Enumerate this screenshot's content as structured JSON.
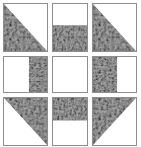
{
  "block": {
    "title": "Patchwork Quilt Block",
    "grid_label": "3x3 quilt block grid",
    "rows": 3,
    "columns": 3,
    "width_px": 141,
    "height_px": 147,
    "colors": {
      "background": "#ffffff",
      "plain_fabric": "#ffffff",
      "print_fabric_base": "#9e9e9e",
      "print_fabric_dark": "#1c1c1c",
      "print_fabric_light": "#c8c8c8",
      "seam_line": "#8d8d8d"
    },
    "fabrics": {
      "plain": "plain-white",
      "print": "mottled-camouflage-print"
    },
    "cells": [
      {
        "id": "cell-r1c1",
        "name": "top-left-corner",
        "patch_type": "half-square-triangle",
        "print_region": "lower-right-triangle",
        "print_polygon": "0,0 100,100 0,100",
        "plain_region": "upper-left-triangle"
      },
      {
        "id": "cell-r1c2",
        "name": "top-center-edge",
        "patch_type": "horizontal-split-rectangle",
        "print_region": "bottom-band",
        "print_polygon": "0,45 100,45 100,100 0,100",
        "plain_region": "top-band",
        "split_percent": 45
      },
      {
        "id": "cell-r1c3",
        "name": "top-right-corner",
        "patch_type": "half-square-triangle",
        "print_region": "lower-left-triangle",
        "print_polygon": "0,0 100,100 0,100",
        "plain_region": "upper-right-triangle"
      },
      {
        "id": "cell-r2c1",
        "name": "middle-left-edge",
        "patch_type": "vertical-split-rectangle",
        "print_region": "right-band",
        "print_polygon": "58,0 100,0 100,100 58,100",
        "plain_region": "left-band",
        "split_percent": 58
      },
      {
        "id": "cell-r2c2",
        "name": "center-square",
        "patch_type": "solid-square",
        "print_region": "none",
        "print_polygon": "",
        "plain_region": "whole-square"
      },
      {
        "id": "cell-r2c3",
        "name": "middle-right-edge",
        "patch_type": "vertical-split-rectangle",
        "print_region": "left-band",
        "print_polygon": "0,0 56,0 56,100 0,100",
        "plain_region": "right-band",
        "split_percent": 56
      },
      {
        "id": "cell-r3c1",
        "name": "bottom-left-corner",
        "patch_type": "half-square-triangle",
        "print_region": "upper-right-triangle",
        "print_polygon": "0,0 100,0 100,100",
        "plain_region": "lower-left-triangle"
      },
      {
        "id": "cell-r3c2",
        "name": "bottom-center-edge",
        "patch_type": "horizontal-split-rectangle",
        "print_region": "top-band",
        "print_polygon": "0,0 100,0 100,48 0,48",
        "plain_region": "bottom-band",
        "split_percent": 48
      },
      {
        "id": "cell-r3c3",
        "name": "bottom-right-corner",
        "patch_type": "half-square-triangle",
        "print_region": "upper-left-triangle",
        "print_polygon": "0,0 100,0 0,100",
        "plain_region": "lower-right-triangle"
      }
    ]
  }
}
